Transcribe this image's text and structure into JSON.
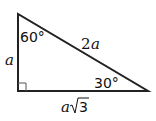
{
  "diagram": {
    "stroke_color": "#222222",
    "vertices": {
      "top": [
        18,
        14
      ],
      "bottom_left": [
        18,
        91
      ],
      "bottom_right": [
        148,
        91
      ]
    },
    "labels": {
      "angle_top": "60°",
      "angle_right": "30°",
      "hypotenuse": "2",
      "hypotenuse_var": "a",
      "vertical_side": "a",
      "base_coef": "a",
      "base_radicand": "3"
    },
    "right_angle_marker": true
  }
}
